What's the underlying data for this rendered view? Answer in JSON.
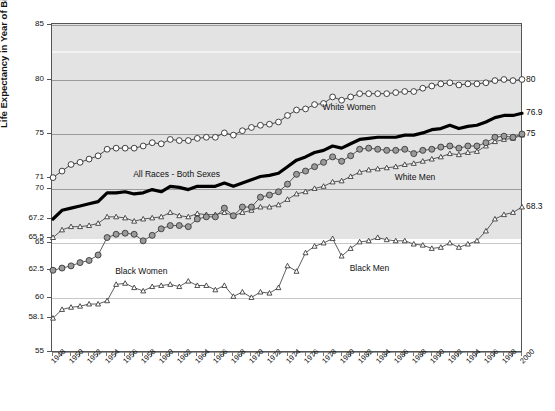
{
  "chart_data": {
    "type": "line",
    "title": "",
    "xlabel": "",
    "ylabel": "Life Expectancy in Year of Birth",
    "xlim": [
      1948,
      2000
    ],
    "ylim": [
      55,
      85
    ],
    "grid": true,
    "legend_position": "inline-annotations",
    "y_ticks_left": [
      "85",
      "80",
      "75",
      "71",
      "70",
      "67.2",
      "65.5",
      "65",
      "62.5",
      "60",
      "58.1",
      "55"
    ],
    "y_tick_values_left": [
      85,
      80,
      75,
      71,
      70,
      67.2,
      65.5,
      65,
      62.5,
      60,
      58.1,
      55
    ],
    "y_ticks_right": [
      "80",
      "76.9",
      "75",
      "68.3"
    ],
    "y_tick_values_right": [
      80,
      76.9,
      75,
      68.3
    ],
    "x_tick_labels": [
      "1948",
      "1950",
      "1952",
      "1954",
      "1956",
      "1958",
      "1960",
      "1962",
      "1964",
      "1966",
      "1968",
      "1970",
      "1972",
      "1974",
      "1976",
      "1978",
      "1980",
      "1982",
      "1984",
      "1986",
      "1988",
      "1990",
      "1992",
      "1994",
      "1996",
      "1998",
      "2000"
    ],
    "x": [
      1948,
      1949,
      1950,
      1951,
      1952,
      1953,
      1954,
      1955,
      1956,
      1957,
      1958,
      1959,
      1960,
      1961,
      1962,
      1963,
      1964,
      1965,
      1966,
      1967,
      1968,
      1969,
      1970,
      1971,
      1972,
      1973,
      1974,
      1975,
      1976,
      1977,
      1978,
      1979,
      1980,
      1981,
      1982,
      1983,
      1984,
      1985,
      1986,
      1987,
      1988,
      1989,
      1990,
      1991,
      1992,
      1993,
      1994,
      1995,
      1996,
      1997,
      1998,
      1999,
      2000
    ],
    "series": [
      {
        "name": "White Women",
        "marker": "open-circle",
        "color": "#222222",
        "fill": "#ffffff",
        "label_x": 1978,
        "label_y": 77.4,
        "end_label": "80",
        "values": [
          71.0,
          71.6,
          72.2,
          72.4,
          72.7,
          73.0,
          73.6,
          73.7,
          73.7,
          73.7,
          73.9,
          74.2,
          74.1,
          74.5,
          74.4,
          74.4,
          74.6,
          74.7,
          74.7,
          75.1,
          74.9,
          75.3,
          75.6,
          75.8,
          75.9,
          76.1,
          76.7,
          77.2,
          77.3,
          77.7,
          77.8,
          78.4,
          78.1,
          78.4,
          78.7,
          78.7,
          78.7,
          78.7,
          78.8,
          78.9,
          78.9,
          79.2,
          79.4,
          79.6,
          79.7,
          79.5,
          79.6,
          79.6,
          79.7,
          79.9,
          80.0,
          79.9,
          80.0
        ]
      },
      {
        "name": "All Races - Both Sexes",
        "marker": "none",
        "color": "#000000",
        "line_weight": "thick",
        "label_x": 1958,
        "label_y": 71.2,
        "end_label": "76.9",
        "values": [
          67.2,
          68.0,
          68.2,
          68.4,
          68.6,
          68.8,
          69.6,
          69.6,
          69.7,
          69.5,
          69.6,
          69.9,
          69.7,
          70.2,
          70.1,
          69.9,
          70.2,
          70.2,
          70.2,
          70.5,
          70.2,
          70.5,
          70.8,
          71.1,
          71.2,
          71.4,
          72.0,
          72.6,
          72.9,
          73.3,
          73.5,
          73.9,
          73.7,
          74.1,
          74.5,
          74.6,
          74.7,
          74.7,
          74.7,
          74.9,
          74.9,
          75.1,
          75.4,
          75.5,
          75.8,
          75.5,
          75.7,
          75.8,
          76.1,
          76.5,
          76.7,
          76.7,
          76.9
        ]
      },
      {
        "name": "White Men",
        "marker": "open-triangle",
        "color": "#333333",
        "fill": "#ffffff",
        "label_x": 1987,
        "label_y": 71.0,
        "end_label": "",
        "values": [
          65.5,
          66.2,
          66.5,
          66.5,
          66.6,
          66.8,
          67.4,
          67.4,
          67.3,
          67.0,
          67.2,
          67.3,
          67.4,
          67.8,
          67.5,
          67.4,
          67.7,
          67.6,
          67.6,
          67.8,
          67.5,
          67.8,
          68.0,
          68.3,
          68.3,
          68.5,
          69.0,
          69.5,
          69.7,
          70.0,
          70.2,
          70.6,
          70.7,
          71.1,
          71.5,
          71.7,
          71.8,
          71.9,
          72.0,
          72.2,
          72.3,
          72.5,
          72.7,
          72.9,
          73.2,
          73.1,
          73.3,
          73.4,
          73.9,
          74.3,
          74.5,
          74.6,
          74.9
        ]
      },
      {
        "name": "Black Women",
        "marker": "filled-circle",
        "color": "#333333",
        "fill": "#9a9a9a",
        "label_x": 1955,
        "label_y": 62.3,
        "end_label": "75",
        "values": [
          62.5,
          62.7,
          62.9,
          63.2,
          63.4,
          63.9,
          65.5,
          65.8,
          65.9,
          65.8,
          65.2,
          65.7,
          66.3,
          66.6,
          66.6,
          66.5,
          67.2,
          67.4,
          67.4,
          68.2,
          67.5,
          68.3,
          68.3,
          69.2,
          69.4,
          69.7,
          70.4,
          71.3,
          71.6,
          72.0,
          72.4,
          72.9,
          72.5,
          73.0,
          73.6,
          73.7,
          73.6,
          73.5,
          73.5,
          73.6,
          73.2,
          73.5,
          73.6,
          73.8,
          73.9,
          73.7,
          73.9,
          73.9,
          74.2,
          74.7,
          74.8,
          74.7,
          75.0
        ]
      },
      {
        "name": "Black Men",
        "marker": "open-triangle",
        "color": "#333333",
        "fill": "#ffffff",
        "label_x": 1981,
        "label_y": 62.6,
        "end_label": "68.3",
        "values": [
          58.1,
          58.9,
          59.1,
          59.2,
          59.4,
          59.4,
          59.7,
          61.2,
          61.3,
          60.9,
          60.6,
          61.0,
          61.1,
          61.2,
          61.0,
          61.5,
          61.1,
          61.1,
          60.7,
          61.1,
          60.1,
          60.5,
          60.0,
          60.5,
          60.4,
          60.9,
          62.9,
          62.4,
          64.1,
          64.7,
          65.0,
          65.4,
          63.8,
          64.5,
          65.1,
          65.2,
          65.5,
          65.3,
          65.2,
          65.2,
          64.9,
          64.8,
          64.5,
          64.6,
          65.0,
          64.6,
          64.9,
          65.2,
          66.1,
          67.2,
          67.6,
          67.8,
          68.3
        ]
      }
    ]
  },
  "annotations": {
    "white_women": "White Women",
    "all_races": "All Races - Both Sexes",
    "white_men": "White Men",
    "black_women": "Black Women",
    "black_men": "Black Men"
  }
}
